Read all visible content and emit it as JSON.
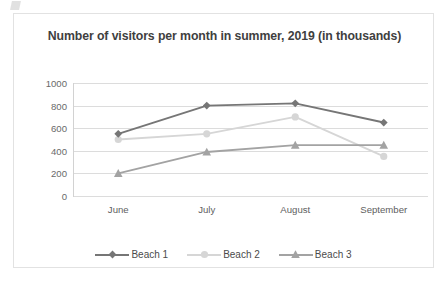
{
  "chart_data": {
    "type": "line",
    "title": "Number of visitors per month in summer, 2019 (in thousands)",
    "xlabel": "",
    "ylabel": "",
    "categories": [
      "June",
      "July",
      "August",
      "September"
    ],
    "yticks": [
      0,
      200,
      400,
      600,
      800,
      1000
    ],
    "ylim": [
      0,
      1000
    ],
    "grid": true,
    "legend_position": "bottom",
    "series": [
      {
        "name": "Beach 1",
        "values": [
          550,
          800,
          820,
          650
        ],
        "color": "#767676",
        "marker": "diamond"
      },
      {
        "name": "Beach 2",
        "values": [
          500,
          550,
          700,
          350
        ],
        "color": "#d6d6d6",
        "marker": "circle"
      },
      {
        "name": "Beach 3",
        "values": [
          200,
          390,
          450,
          450
        ],
        "color": "#a3a3a3",
        "marker": "triangle"
      }
    ]
  },
  "axis": {
    "y_labels": [
      "1000",
      "800",
      "600",
      "400",
      "200",
      "0"
    ],
    "x_labels": [
      "June",
      "July",
      "August",
      "September"
    ]
  },
  "legend": {
    "items": [
      {
        "label": "Beach 1"
      },
      {
        "label": "Beach 2"
      },
      {
        "label": "Beach 3"
      }
    ]
  }
}
